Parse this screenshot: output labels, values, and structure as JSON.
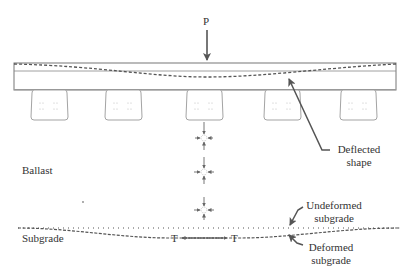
{
  "diagram": {
    "load_label": "P",
    "ballast_label": "Ballast",
    "subgrade_label": "Subgrade",
    "deflected_shape_label": [
      "Deflected",
      "shape"
    ],
    "undeformed_subgrade_label": [
      "Undeformed",
      "subgrade"
    ],
    "deformed_subgrade_label": [
      "Deformed",
      "subgrade"
    ],
    "tension_left": "T",
    "tension_right": "T",
    "sleeper_count": 5,
    "stress_element_count": 3,
    "colors": {
      "line": "#555555",
      "text": "#333333",
      "background": "#ffffff"
    }
  }
}
